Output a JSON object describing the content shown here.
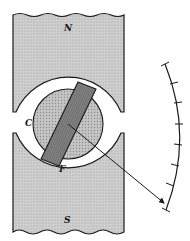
{
  "diagram": {
    "type": "moving-coil galvanometer schematic",
    "labels": {
      "north_pole": "N",
      "south_pole": "S",
      "core": "C",
      "coil": "F"
    },
    "colors": {
      "magnet_fill": "#c8c8c8",
      "core_fill": "#bdbdbd",
      "coil_fill": "#8a8a8a",
      "line": "#1a1a1a",
      "background": "#ffffff"
    },
    "scale": {
      "tick_count": 8
    }
  }
}
